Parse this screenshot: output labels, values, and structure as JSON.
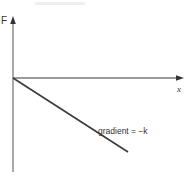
{
  "diagram": {
    "type": "force-extension graph",
    "axes": {
      "y_label": "F",
      "x_label": "x"
    },
    "line": {
      "description": "straight line through origin with negative slope",
      "annotation": "gradient = −k"
    },
    "colors": {
      "axis": "#7a7a7a",
      "line": "#3a3a3a",
      "text": "#333333",
      "background": "#ffffff"
    }
  }
}
